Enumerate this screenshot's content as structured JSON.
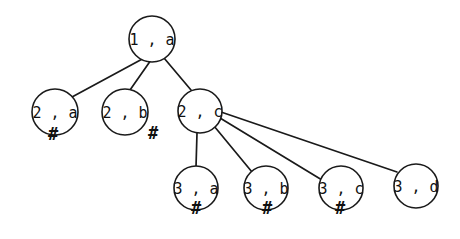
{
  "diagram": {
    "type": "tree",
    "title": "",
    "background_color": "#ffffff",
    "stroke_color": "#1a1a1a",
    "text_color": "#111111",
    "terminal_symbol": "#",
    "nodes": [
      {
        "id": "n1",
        "label": "1 , a",
        "cx": 152,
        "cy": 39,
        "r": 23,
        "terminal": false,
        "mark": "",
        "mark_x": 0,
        "mark_y": 0,
        "depth": 1
      },
      {
        "id": "n2a",
        "label": "2 , a",
        "cx": 55,
        "cy": 112,
        "r": 23,
        "terminal": true,
        "mark": "#",
        "mark_x": 53,
        "mark_y": 135,
        "depth": 2
      },
      {
        "id": "n2b",
        "label": "2 , b",
        "cx": 125,
        "cy": 112,
        "r": 23,
        "terminal": true,
        "mark": "#",
        "mark_x": 153,
        "mark_y": 134,
        "depth": 2
      },
      {
        "id": "n2c",
        "label": "2 , c",
        "cx": 200,
        "cy": 111,
        "r": 22,
        "terminal": false,
        "mark": "",
        "mark_x": 0,
        "mark_y": 0,
        "depth": 2
      },
      {
        "id": "n3a",
        "label": "3 , a",
        "cx": 196,
        "cy": 188,
        "r": 22,
        "terminal": true,
        "mark": "#",
        "mark_x": 196,
        "mark_y": 209,
        "depth": 3
      },
      {
        "id": "n3b",
        "label": "3 , b",
        "cx": 266,
        "cy": 188,
        "r": 22,
        "terminal": true,
        "mark": "#",
        "mark_x": 267,
        "mark_y": 209,
        "depth": 3
      },
      {
        "id": "n3c",
        "label": "3 , c",
        "cx": 341,
        "cy": 188,
        "r": 22,
        "terminal": true,
        "mark": "#",
        "mark_x": 340,
        "mark_y": 209,
        "depth": 3
      },
      {
        "id": "n3d",
        "label": "3 , d",
        "cx": 416,
        "cy": 186,
        "r": 22,
        "terminal": false,
        "mark": "",
        "mark_x": 0,
        "mark_y": 0,
        "depth": 3
      }
    ],
    "edges": [
      {
        "id": "e1",
        "from": "n1",
        "to": "n2a",
        "x1": 146,
        "y1": 57,
        "x2": 72,
        "y2": 97
      },
      {
        "id": "e2",
        "from": "n1",
        "to": "n2b",
        "x1": 151,
        "y1": 60,
        "x2": 130,
        "y2": 90
      },
      {
        "id": "e3",
        "from": "n1",
        "to": "n2c",
        "x1": 164,
        "y1": 58,
        "x2": 191,
        "y2": 90
      },
      {
        "id": "e4",
        "from": "n2c",
        "to": "n3a",
        "x1": 197,
        "y1": 133,
        "x2": 196,
        "y2": 167
      },
      {
        "id": "e5",
        "from": "n2c",
        "to": "n3b",
        "x1": 214,
        "y1": 126,
        "x2": 252,
        "y2": 172
      },
      {
        "id": "e6",
        "from": "n2c",
        "to": "n3c",
        "x1": 220,
        "y1": 118,
        "x2": 322,
        "y2": 180
      },
      {
        "id": "e7",
        "from": "n2c",
        "to": "n3d",
        "x1": 221,
        "y1": 112,
        "x2": 397,
        "y2": 172
      }
    ]
  }
}
